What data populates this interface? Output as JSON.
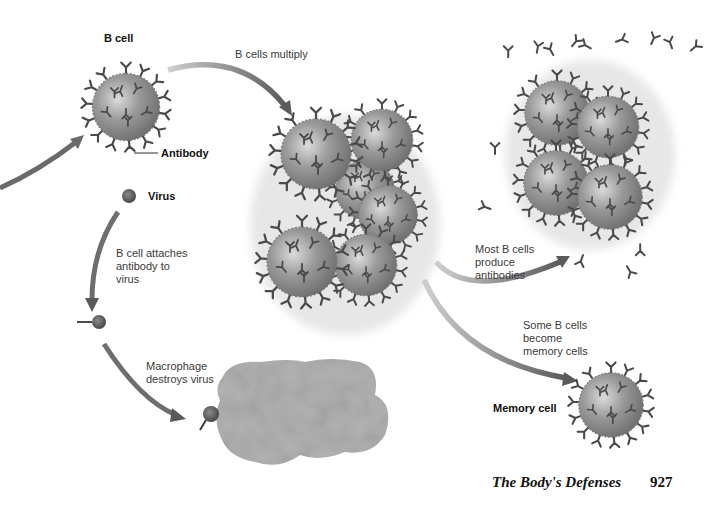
{
  "diagram": {
    "labels": {
      "b_cell": "B cell",
      "antibody": "Antibody",
      "b_cells_multiply": "B cells multiply",
      "virus": "Virus",
      "attach_line1": "B cell attaches",
      "attach_line2": "antibody to",
      "attach_line3": "virus",
      "macrophage_line1": "Macrophage",
      "macrophage_line2": "destroys virus",
      "most_line1": "Most B cells",
      "most_line2": "produce",
      "most_line3": "antibodies",
      "some_line1": "Some B cells",
      "some_line2": "become",
      "some_line3": "memory cells",
      "memory_cell": "Memory cell"
    },
    "colors": {
      "cell_fill": "#8a8a8a",
      "cell_highlight": "#d6d6d6",
      "antibody": "#4a4a4a",
      "arrow": "#6e6e6e",
      "macrophage": "#b4b4b4",
      "virus": "#555555"
    }
  },
  "footer": {
    "title": "The Body's Defenses",
    "page_number": "927"
  }
}
